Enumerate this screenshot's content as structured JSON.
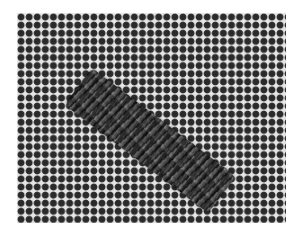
{
  "image": {
    "subject": "needlepoint canvas with a diagonal stitched band",
    "description": "Photograph of a grid-patterned needlepoint canvas with a diagonal band of dark woven stitches"
  },
  "colors": {
    "canvas_threads": "#e6e6e6",
    "canvas_holes": "#2a2a2a",
    "stitch_dark": "#3a3a3a",
    "stitch_mid": "#555555",
    "stitch_light": "#777777",
    "background": "#ffffff"
  }
}
